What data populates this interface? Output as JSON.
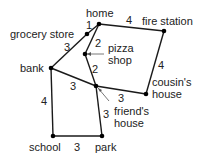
{
  "diagram": {
    "type": "weighted-graph-map",
    "nodes": [
      {
        "id": "home",
        "label": "home",
        "x": 99,
        "y": 24
      },
      {
        "id": "fire_station",
        "label": "fire station",
        "x": 164,
        "y": 31
      },
      {
        "id": "grocery_store",
        "label": "grocery store",
        "x": 87,
        "y": 34
      },
      {
        "id": "pizza_shop",
        "label": "pizza shop",
        "x": 85,
        "y": 54
      },
      {
        "id": "bank",
        "label": "bank",
        "x": 51,
        "y": 68
      },
      {
        "id": "friends_house",
        "label": "friend's house",
        "x": 96,
        "y": 86
      },
      {
        "id": "cousins_house",
        "label": "cousin's house",
        "x": 146,
        "y": 94
      },
      {
        "id": "school",
        "label": "school",
        "x": 53,
        "y": 136
      },
      {
        "id": "park",
        "label": "park",
        "x": 102,
        "y": 136
      }
    ],
    "edges": [
      {
        "from": "home",
        "to": "grocery_store",
        "weight": "1"
      },
      {
        "from": "home",
        "to": "fire_station",
        "weight": "4"
      },
      {
        "from": "home",
        "to": "pizza_shop",
        "weight": "2"
      },
      {
        "from": "grocery_store",
        "to": "bank",
        "weight": "3"
      },
      {
        "from": "pizza_shop",
        "to": "friends_house",
        "weight": "2"
      },
      {
        "from": "fire_station",
        "to": "cousins_house",
        "weight": "4"
      },
      {
        "from": "bank",
        "to": "friends_house",
        "weight": "3"
      },
      {
        "from": "friends_house",
        "to": "cousins_house",
        "weight": "3"
      },
      {
        "from": "bank",
        "to": "school",
        "weight": "4"
      },
      {
        "from": "friends_house",
        "to": "park",
        "weight": "3"
      },
      {
        "from": "school",
        "to": "park",
        "weight": "3"
      }
    ],
    "labels": {
      "home": "home",
      "fire_station": "fire station",
      "grocery_store": "grocery store",
      "pizza_line1": "pizza",
      "pizza_line2": "shop",
      "bank": "bank",
      "friend_line1": "friend's",
      "friend_line2": "house",
      "cousin_line1": "cousin's",
      "cousin_line2": "house",
      "school": "school",
      "park": "park"
    },
    "weights": {
      "home_grocery": "1",
      "home_fire": "4",
      "home_pizza": "2",
      "grocery_bank": "3",
      "pizza_friend": "2",
      "fire_cousin": "4",
      "bank_friend": "3",
      "friend_cousin": "3",
      "bank_school": "4",
      "friend_park": "3",
      "school_park": "3"
    }
  }
}
